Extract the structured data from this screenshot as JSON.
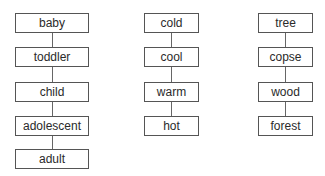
{
  "columns": [
    {
      "name": "age-stages",
      "items": [
        "baby",
        "toddler",
        "child",
        "adolescent",
        "adult"
      ]
    },
    {
      "name": "temperature",
      "items": [
        "cold",
        "cool",
        "warm",
        "hot"
      ]
    },
    {
      "name": "woodland-size",
      "items": [
        "tree",
        "copse",
        "wood",
        "forest"
      ]
    }
  ],
  "colors": {
    "border": "#555555",
    "text": "#2a2a2a",
    "connector": "#666666",
    "background": "#ffffff"
  }
}
